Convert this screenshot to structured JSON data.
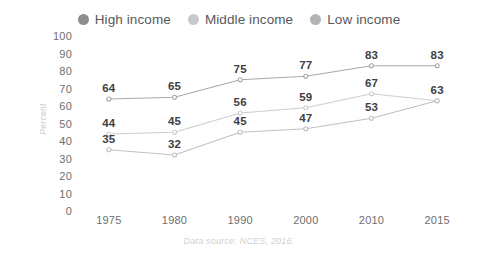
{
  "legend": {
    "position": "top-center",
    "entries": [
      {
        "label": "High income",
        "marker": "legend-dot-icon",
        "color": "#8d8d8f"
      },
      {
        "label": "Middle income",
        "marker": "legend-dot-icon",
        "color": "#c8c9ca"
      },
      {
        "label": "Low income",
        "marker": "legend-dot-icon",
        "color": "#b3b4b5"
      }
    ]
  },
  "source_note": "Data source: NCES, 2016.",
  "chart_data": {
    "type": "line",
    "title": "",
    "subtitle": "",
    "xlabel": "",
    "ylabel": "Percent",
    "categories": [
      "1975",
      "1980",
      "1990",
      "2000",
      "2010",
      "2015"
    ],
    "ylim": [
      0,
      100
    ],
    "yticks": [
      100,
      90,
      80,
      70,
      60,
      50,
      40,
      30,
      20,
      10,
      0
    ],
    "grid": false,
    "markers": true,
    "data_labels": true,
    "series": [
      {
        "name": "High income",
        "color": "#a8a9ab",
        "values": [
          64,
          65,
          75,
          77,
          83,
          83
        ],
        "labels": [
          "64",
          "65",
          "75",
          "77",
          "83",
          "83"
        ]
      },
      {
        "name": "Middle income",
        "color": "#cdcecf",
        "values": [
          44,
          45,
          56,
          59,
          67,
          63
        ],
        "labels": [
          "44",
          "45",
          "56",
          "59",
          "67",
          "63"
        ]
      },
      {
        "name": "Low income",
        "color": "#c0c1c2",
        "values": [
          35,
          32,
          45,
          47,
          53,
          63
        ],
        "labels": [
          "35",
          "32",
          "45",
          "47",
          "53",
          ""
        ]
      }
    ]
  }
}
